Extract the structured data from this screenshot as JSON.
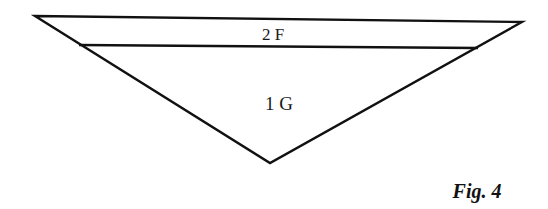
{
  "diagram": {
    "outer_triangle": {
      "top_left": [
        35,
        16
      ],
      "top_right": [
        522,
        22
      ],
      "bottom_vertex": [
        270,
        163
      ]
    },
    "inner_line": {
      "left": [
        79,
        45
      ],
      "right": [
        478,
        48
      ]
    },
    "labels": {
      "upper_band": "2 F",
      "lower_triangle": "1 G"
    },
    "caption": "Fig. 4",
    "stroke_color": "#111111"
  }
}
